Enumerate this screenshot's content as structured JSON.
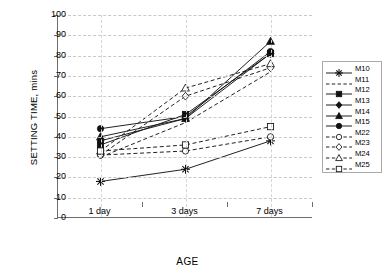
{
  "chart_data": {
    "type": "line",
    "title": "",
    "xlabel": "AGE",
    "ylabel": "SETTING TIME, mins",
    "categories": [
      "1 day",
      "3 days",
      "7 days"
    ],
    "ylim": [
      0,
      100
    ],
    "yticks": [
      0,
      10,
      20,
      30,
      40,
      50,
      60,
      70,
      80,
      90,
      100
    ],
    "grid": true,
    "legend_position": "right",
    "series": [
      {
        "name": "M10",
        "values": [
          18,
          24,
          38
        ],
        "marker": "star",
        "line": "solid",
        "fill": "solid"
      },
      {
        "name": "M11",
        "values": [
          30,
          47,
          72
        ],
        "marker": "none",
        "line": "dashed",
        "fill": "none"
      },
      {
        "name": "M12",
        "values": [
          36,
          51,
          81
        ],
        "marker": "square",
        "line": "solid",
        "fill": "solid"
      },
      {
        "name": "M13",
        "values": [
          38,
          49,
          81
        ],
        "marker": "diamond",
        "line": "solid",
        "fill": "solid"
      },
      {
        "name": "M14",
        "values": [
          40,
          49,
          87
        ],
        "marker": "triangle",
        "line": "solid",
        "fill": "solid"
      },
      {
        "name": "M15",
        "values": [
          44,
          50,
          82
        ],
        "marker": "circle",
        "line": "solid",
        "fill": "solid"
      },
      {
        "name": "M22",
        "values": [
          31,
          33,
          40
        ],
        "marker": "open-circle",
        "line": "dashed",
        "fill": "none"
      },
      {
        "name": "M23",
        "values": [
          31,
          60,
          74
        ],
        "marker": "open-diamond",
        "line": "dashed",
        "fill": "none"
      },
      {
        "name": "M24",
        "values": [
          33,
          64,
          76
        ],
        "marker": "open-triangle",
        "line": "dashed",
        "fill": "none"
      },
      {
        "name": "M25",
        "values": [
          33,
          36,
          45
        ],
        "marker": "open-square",
        "line": "dashed",
        "fill": "none"
      }
    ]
  },
  "axis": {
    "y_title": "SETTING TIME, mins",
    "x_title": "AGE"
  },
  "colors": {
    "line": "#1a1a1a",
    "grid": "#c9c9c9",
    "axis": "#6d6d6d",
    "background": "#ffffff"
  }
}
